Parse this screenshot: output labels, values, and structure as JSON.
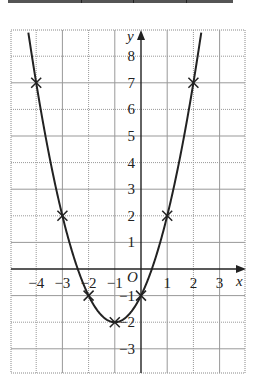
{
  "chart_data": {
    "type": "line",
    "title": "",
    "function": "y = x^2 + 2x - 1",
    "xlabel": "x",
    "ylabel": "y",
    "origin_label": "O",
    "xlim": [
      -5,
      4
    ],
    "ylim": [
      -3.9,
      9
    ],
    "grid": true,
    "x_ticks": [
      -4,
      -3,
      -2,
      -1,
      1,
      2,
      3
    ],
    "x_tick_labels": [
      "−4",
      "−3",
      "−2",
      "−1",
      "1",
      "2",
      "3"
    ],
    "y_ticks": [
      8,
      7,
      6,
      5,
      4,
      3,
      2,
      1,
      -1,
      -2,
      -3
    ],
    "y_tick_labels": [
      "8",
      "7",
      "6",
      "5",
      "4",
      "3",
      "2",
      "1",
      "−1",
      "−2",
      "−3"
    ],
    "marked_points": [
      {
        "x": -4,
        "y": 7
      },
      {
        "x": -3,
        "y": 2
      },
      {
        "x": -2,
        "y": -1
      },
      {
        "x": -1,
        "y": -2
      },
      {
        "x": 0,
        "y": -1
      },
      {
        "x": 1,
        "y": 2
      },
      {
        "x": 2,
        "y": 7
      }
    ],
    "marker": "cross",
    "line_color": "#222222"
  }
}
